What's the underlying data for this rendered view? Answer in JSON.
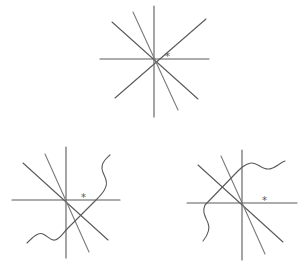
{
  "diagram": {
    "figures": [
      {
        "id": "top",
        "center": [
          154,
          59
        ],
        "marker": "*",
        "marker_pos": [
          167,
          58
        ],
        "has_wave": false
      },
      {
        "id": "bottom-left",
        "center": [
          66,
          200
        ],
        "marker": "*",
        "marker_pos": [
          82,
          197
        ],
        "has_wave": true
      },
      {
        "id": "bottom-right",
        "center": [
          242,
          203
        ],
        "marker": "*",
        "marker_pos": [
          263,
          201
        ],
        "has_wave": true
      }
    ],
    "colors": {
      "line": "#5a5a5a",
      "background": "#ffffff"
    }
  }
}
